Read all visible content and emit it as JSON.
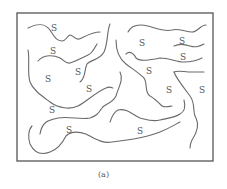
{
  "figure": {
    "caption": "(a)",
    "frame": {
      "x": 17,
      "y": 13,
      "width": 196,
      "height": 148,
      "stroke": "#555555"
    },
    "curve_color": "#6a6a6a",
    "label_text": "S",
    "labels": [
      {
        "text": "S",
        "x": 51,
        "y": 31
      },
      {
        "text": "S",
        "x": 50,
        "y": 54
      },
      {
        "text": "S",
        "x": 75,
        "y": 75
      },
      {
        "text": "S",
        "x": 45,
        "y": 82
      },
      {
        "text": "S",
        "x": 86,
        "y": 92
      },
      {
        "text": "S",
        "x": 49,
        "y": 113
      },
      {
        "text": "S",
        "x": 66,
        "y": 133
      },
      {
        "text": "S",
        "x": 139,
        "y": 46
      },
      {
        "text": "S",
        "x": 179,
        "y": 44
      },
      {
        "text": "S",
        "x": 180,
        "y": 60
      },
      {
        "text": "S",
        "x": 146,
        "y": 74
      },
      {
        "text": "S",
        "x": 166,
        "y": 93
      },
      {
        "text": "S",
        "x": 199,
        "y": 93
      },
      {
        "text": "S",
        "x": 137,
        "y": 134
      }
    ],
    "curves": [
      "M28,28 C36,24 44,22 50,30 C54,36 56,41 62,41 C66,41 67,36 70,35 C73,35 75,40 79,39 C84,37 92,32 100,32",
      "M110,24 C107,30 108,44 104,52 C100,60 90,60 87,64 C84,70 86,78 80,82",
      "M38,61 C44,54 54,55 60,58 C64,60 66,64 70,63 C76,61 82,58 88,55 C93,53 95,47 97,44",
      "M28,50 C30,60 27,72 30,82 C33,90 42,96 50,102 C58,108 70,110 78,106 C86,102 96,92 106,88 C110,86 112,88 113,88",
      "M120,72 C124,80 118,88 116,96 C112,104 104,104 102,108 C98,114 96,116 90,118 C80,120 70,116 58,118 C48,120 42,122 40,134",
      "M32,126 C28,130 28,138 30,144 C34,152 40,156 50,152 C56,150 62,144 66,136 C72,130 80,132 86,134 C94,138 102,144 112,142 C130,140 150,136 160,132 C170,128 176,124 180,122",
      "M116,40 C116,50 118,58 126,64 C134,70 140,74 144,78 C148,84 144,92 150,96 C154,98 158,102 162,106 C166,108 170,106 172,106",
      "M128,32 C132,24 140,24 148,26 C156,28 164,32 172,30 C178,28 186,32 192,32 C198,32 200,25 206,25",
      "M126,54 C130,50 134,54 136,58 C140,62 150,60 160,58 C170,58 176,62 184,62 C192,62 198,60 202,58",
      "M174,46 C178,44 184,44 190,46 C196,48 200,46 204,44",
      "M174,72 C178,70 184,72 192,72 C198,72 202,72 204,72",
      "M174,72 C176,78 184,88 190,96 C196,104 192,112 196,118 C200,126 196,134 192,140 C190,144 190,146 190,148",
      "M184,100 C186,108 184,112 180,114 C174,118 168,118 160,120 C152,122 148,120 140,118 C132,114 126,108 118,110 C114,112 112,116 110,122"
    ]
  }
}
